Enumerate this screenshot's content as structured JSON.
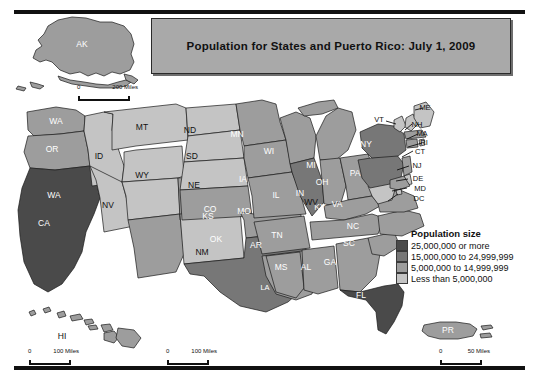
{
  "title": {
    "text": "Population for States and Puerto Rico: July 1, 2009"
  },
  "legend": {
    "heading": "Population size",
    "classes": [
      {
        "label": "25,000,000 or more",
        "color": "#4a4a4a"
      },
      {
        "label": "15,000,000 to 24,999,999",
        "color": "#777777"
      },
      {
        "label": "5,000,000 to 14,999,999",
        "color": "#9d9d9d"
      },
      {
        "label": "Less than 5,000,000",
        "color": "#c4c4c4"
      }
    ]
  },
  "scale_bars": [
    {
      "name": "alaska",
      "zero": "0",
      "max": "200 Miles"
    },
    {
      "name": "hawaii",
      "zero": "0",
      "max": "100 Miles"
    },
    {
      "name": "continental",
      "zero": "0",
      "max": "100 Miles"
    },
    {
      "name": "puerto-rico",
      "zero": "0",
      "max": "50 Miles"
    }
  ],
  "map": {
    "states": [
      {
        "code": "AK",
        "class": 3
      },
      {
        "code": "HI",
        "class": 3
      },
      {
        "code": "PR",
        "class": 2
      },
      {
        "code": "WA",
        "class": 2
      },
      {
        "code": "OR",
        "class": 2
      },
      {
        "code": "CA",
        "class": 0
      },
      {
        "code": "ID",
        "class": 3
      },
      {
        "code": "NV",
        "class": 3
      },
      {
        "code": "MT",
        "class": 3
      },
      {
        "code": "WY",
        "class": 3
      },
      {
        "code": "UT",
        "class": 3
      },
      {
        "code": "AZ",
        "class": 2
      },
      {
        "code": "CO",
        "class": 2
      },
      {
        "code": "NM",
        "class": 3
      },
      {
        "code": "ND",
        "class": 3
      },
      {
        "code": "SD",
        "class": 3
      },
      {
        "code": "NE",
        "class": 3
      },
      {
        "code": "KS",
        "class": 2
      },
      {
        "code": "OK",
        "class": 2
      },
      {
        "code": "TX",
        "class": 1
      },
      {
        "code": "MN",
        "class": 2
      },
      {
        "code": "IA",
        "class": 2
      },
      {
        "code": "MO",
        "class": 2
      },
      {
        "code": "AR",
        "class": 2
      },
      {
        "code": "LA",
        "class": 2
      },
      {
        "code": "WI",
        "class": 2
      },
      {
        "code": "IL",
        "class": 1
      },
      {
        "code": "MI",
        "class": 2
      },
      {
        "code": "IN",
        "class": 2
      },
      {
        "code": "OH",
        "class": 2
      },
      {
        "code": "KY",
        "class": 2
      },
      {
        "code": "TN",
        "class": 2
      },
      {
        "code": "MS",
        "class": 2
      },
      {
        "code": "AL",
        "class": 2
      },
      {
        "code": "GA",
        "class": 2
      },
      {
        "code": "FL",
        "class": 0
      },
      {
        "code": "SC",
        "class": 2
      },
      {
        "code": "NC",
        "class": 2
      },
      {
        "code": "VA",
        "class": 2
      },
      {
        "code": "WV",
        "class": 3
      },
      {
        "code": "PA",
        "class": 1
      },
      {
        "code": "NY",
        "class": 1
      },
      {
        "code": "VT",
        "class": 3
      },
      {
        "code": "NH",
        "class": 3
      },
      {
        "code": "ME",
        "class": 3
      },
      {
        "code": "MA",
        "class": 2
      },
      {
        "code": "RI",
        "class": 3
      },
      {
        "code": "CT",
        "class": 2
      },
      {
        "code": "NJ",
        "class": 2
      },
      {
        "code": "DE",
        "class": 3
      },
      {
        "code": "MD",
        "class": 2
      },
      {
        "code": "DC",
        "class": 3
      }
    ],
    "inset_labels": [
      {
        "code": "AK"
      },
      {
        "code": "HI"
      },
      {
        "code": "PR"
      }
    ],
    "callout_labels": [
      "VT",
      "ME",
      "NH",
      "MA",
      "RI",
      "CT",
      "NJ",
      "DE",
      "MD",
      "DC"
    ]
  }
}
